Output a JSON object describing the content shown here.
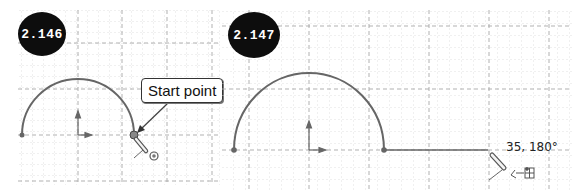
{
  "figures": [
    {
      "badge": "2.146",
      "callout": "Start point",
      "description": "Semicircle arc sketched; cursor at arc end (start point of next entity)"
    },
    {
      "badge": "2.147",
      "coord_readout": "35, 180°",
      "description": "Line being drawn horizontally from arc endpoint"
    }
  ],
  "icons": {
    "pencil_cursor": "pencil-cursor-icon",
    "concentric_snap": "concentric-snap-icon",
    "line_grid_snap": "line-grid-snap-icon",
    "origin_axes": "origin-axes-icon"
  },
  "colors": {
    "sketch_line": "#666666",
    "grid_major": "#aaaaaa",
    "grid_minor": "#d6d6d6",
    "badge_bg": "#0d0d0d",
    "badge_text": "#ffffff"
  }
}
